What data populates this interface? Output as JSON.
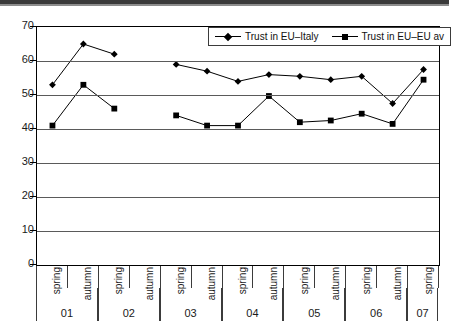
{
  "chart_data": {
    "type": "line",
    "title": "",
    "xlabel": "",
    "ylabel": "",
    "ylim": [
      0,
      70
    ],
    "ytick_step": 10,
    "grid": true,
    "legend_position": "top-right",
    "yticks": [
      "0",
      "10",
      "20",
      "30",
      "40",
      "50",
      "60",
      "70"
    ],
    "categories": [
      "spring",
      "autumn",
      "spring",
      "autumn",
      "spring",
      "autumn",
      "spring",
      "autumn",
      "spring",
      "autumn",
      "spring",
      "autumn",
      "spring"
    ],
    "year_groups": [
      {
        "label": "01",
        "span": 2
      },
      {
        "label": "02",
        "span": 2
      },
      {
        "label": "03",
        "span": 2
      },
      {
        "label": "04",
        "span": 2
      },
      {
        "label": "05",
        "span": 2
      },
      {
        "label": "06",
        "span": 2
      },
      {
        "label": "07",
        "span": 1
      }
    ],
    "series": [
      {
        "name": "Trust in EU–Italy",
        "marker": "diamond",
        "values": [
          53,
          65,
          62,
          null,
          59,
          57,
          54,
          56,
          55.5,
          54.5,
          55.5,
          47.5,
          57.5
        ]
      },
      {
        "name": "Trust in EU–EU av",
        "marker": "square",
        "values": [
          41,
          53,
          46,
          null,
          44,
          41,
          41,
          49.7,
          42,
          42.5,
          44.5,
          41.5,
          54.5
        ]
      }
    ],
    "colors": {
      "series_line": "#000000",
      "gridline": "#5a5a5a",
      "axis": "#000000",
      "background": "#ffffff"
    }
  },
  "legend": {
    "entries": [
      {
        "label": "Trust in EU–Italy",
        "marker": "diamond-marker-icon"
      },
      {
        "label": "Trust in EU–EU av",
        "marker": "square-marker-icon"
      }
    ]
  }
}
